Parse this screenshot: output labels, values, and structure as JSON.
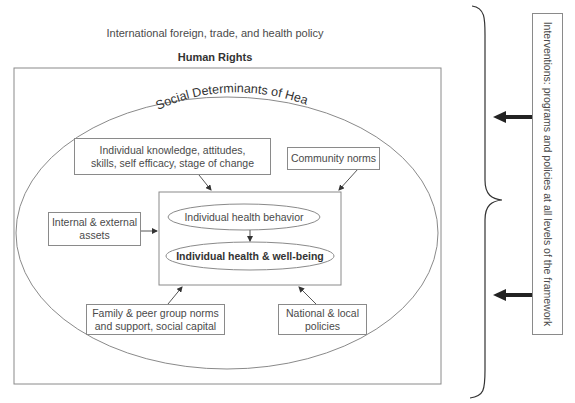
{
  "diagram": {
    "top_label": "International foreign, trade, and health policy",
    "outer_frame_label": "Human Rights",
    "ellipse_label": "Social Determinants of Health",
    "inner_core": {
      "behavior": "Individual health behavior",
      "outcome": "Individual health & well-being"
    },
    "factors": {
      "knowledge_line1": "Individual knowledge, attitudes,",
      "knowledge_line2": "skills, self efficacy, stage of change",
      "community": "Community norms",
      "assets_line1": "Internal & external",
      "assets_line2": "assets",
      "family_line1": "Family & peer group norms",
      "family_line2": "and support, social capital",
      "national_line1": "National & local",
      "national_line2": "policies"
    },
    "interventions": "Interventions: programs and policies at  all levels of the framework"
  },
  "colors": {
    "line": "#8a8a8a",
    "text": "#4a4a4a",
    "arrow": "#222222"
  }
}
